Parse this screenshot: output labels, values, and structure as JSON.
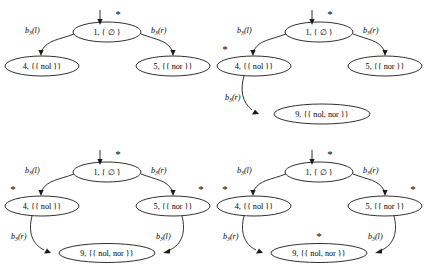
{
  "figure": {
    "background_color": "#ffffff",
    "ink_color": "#1a1a1a",
    "panel_count": 4
  },
  "labels": {
    "node1": "1, { ∅ }",
    "node4": "4, {{ nol }}",
    "node5": "5, {{ nor }}",
    "node9": "9, {{ nol, nor }}",
    "node1_id": "1, {",
    "empty_set": "∅",
    "node1_close": "}",
    "node4_id": "4, {{",
    "node4_val": "nol",
    "node4_close": "}}",
    "node5_id": "5, {{",
    "node5_val": "nor",
    "node5_close": "}}",
    "node9_id": "9, {{",
    "node9_val": "nol, nor",
    "node9_close": "}}",
    "edge_b3l": "b",
    "edge_b3l_sub": "3",
    "edge_b3l_arg": "(l)",
    "edge_b3r_arg": "(r)",
    "star": "*"
  },
  "panels": [
    {
      "name": "panel-top-left",
      "nodes": [
        {
          "id": "1",
          "label": "1, { ∅ }",
          "starred": true
        },
        {
          "id": "4",
          "label": "4, {{ nol }}",
          "starred": false
        },
        {
          "id": "5",
          "label": "5, {{ nor }}",
          "starred": false
        }
      ],
      "edges": [
        {
          "from": "1",
          "to": "4",
          "label": "b3(l)"
        },
        {
          "from": "1",
          "to": "5",
          "label": "b3(r)"
        }
      ]
    },
    {
      "name": "panel-top-right",
      "nodes": [
        {
          "id": "1",
          "label": "1, { ∅ }",
          "starred": true
        },
        {
          "id": "4",
          "label": "4, {{ nol }}",
          "starred": true
        },
        {
          "id": "5",
          "label": "5, {{ nor }}",
          "starred": false
        },
        {
          "id": "9",
          "label": "9, {{ nol, nor }}",
          "starred": false
        }
      ],
      "edges": [
        {
          "from": "1",
          "to": "4",
          "label": "b3(l)"
        },
        {
          "from": "1",
          "to": "5",
          "label": "b3(r)"
        },
        {
          "from": "4",
          "to": "9",
          "label": "b3(r)"
        }
      ]
    },
    {
      "name": "panel-bottom-left",
      "nodes": [
        {
          "id": "1",
          "label": "1, { ∅ }",
          "starred": true
        },
        {
          "id": "4",
          "label": "4, {{ nol }}",
          "starred": true
        },
        {
          "id": "5",
          "label": "5, {{ nor }}",
          "starred": true
        },
        {
          "id": "9",
          "label": "9, {{ nol, nor }}",
          "starred": false
        }
      ],
      "edges": [
        {
          "from": "1",
          "to": "4",
          "label": "b3(l)"
        },
        {
          "from": "1",
          "to": "5",
          "label": "b3(r)"
        },
        {
          "from": "4",
          "to": "9",
          "label": "b3(r)"
        },
        {
          "from": "5",
          "to": "9",
          "label": "b3(l)"
        }
      ]
    },
    {
      "name": "panel-bottom-right",
      "nodes": [
        {
          "id": "1",
          "label": "1, { ∅ }",
          "starred": true
        },
        {
          "id": "4",
          "label": "4, {{ nol }}",
          "starred": true
        },
        {
          "id": "5",
          "label": "5, {{ nor }}",
          "starred": true
        },
        {
          "id": "9",
          "label": "9, {{ nol, nor }}",
          "starred": true
        }
      ],
      "edges": [
        {
          "from": "1",
          "to": "4",
          "label": "b3(l)"
        },
        {
          "from": "1",
          "to": "5",
          "label": "b3(r)"
        },
        {
          "from": "4",
          "to": "9",
          "label": "b3(r)"
        },
        {
          "from": "5",
          "to": "9",
          "label": "b3(l)"
        }
      ]
    }
  ]
}
